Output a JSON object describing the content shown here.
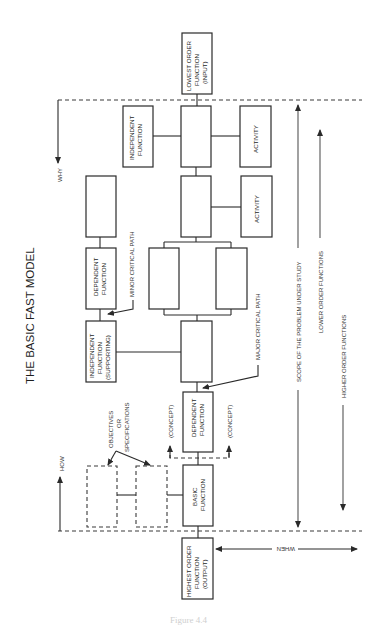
{
  "diagram": {
    "title": "THE BASIC FAST MODEL",
    "orientation": "rotated 90deg counter-clockwise",
    "colors": {
      "line": "#2a2a2a",
      "background": "#ffffff"
    },
    "directions": {
      "how": "HOW",
      "why": "WHY",
      "when": "WHEN"
    },
    "boxes": {
      "lowest_order": [
        "LOWEST ORDER",
        "FUNCTION",
        "(INPUT)"
      ],
      "highest_order": [
        "HIGHEST ORDER",
        "FUNCTION",
        "(OUTPUT)"
      ],
      "basic_function": [
        "BASIC",
        "FUNCTION"
      ],
      "dependent_function_main": [
        "DEPENDENT",
        "FUNCTION"
      ],
      "dependent_function_minor": [
        "DEPENDENT",
        "FUNCTION"
      ],
      "independent_function_top": [
        "INDEPENDENT",
        "FUNCTION"
      ],
      "independent_function_supporting": [
        "INDEPENDENT",
        "FUNCTION",
        "(SUPPORTING)"
      ],
      "activity_1": "ACTIVITY",
      "activity_2": "ACTIVITY"
    },
    "annotations": {
      "minor_critical_path": "MINOR CRITICAL PATH",
      "major_critical_path": "MAJOR CRITICAL PATH",
      "concept_left": "(CONCEPT)",
      "concept_right": "(CONCEPT)",
      "objectives": [
        "OBJECTIVES",
        "OR",
        "SPECIFICATIONS"
      ]
    },
    "scope_labels": {
      "scope": "SCOPE OF THE PROBLEM UNDER STUDY",
      "lower_order": "LOWER ORDER FUNCTIONS",
      "higher_order": "HIGHER ORDER FUNCTIONS"
    },
    "caption": "Figure 4.4"
  }
}
